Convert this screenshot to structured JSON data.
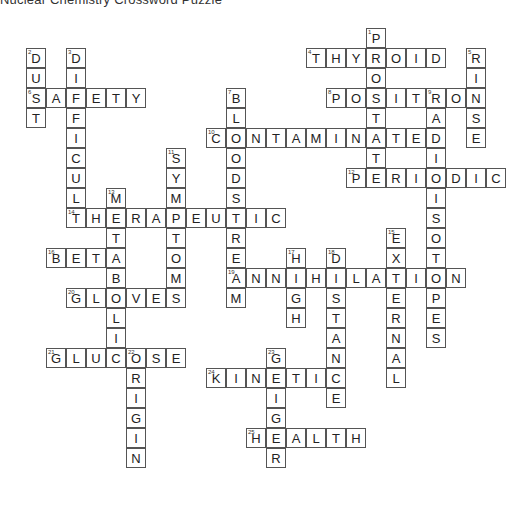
{
  "title": "Nuclear Chemistry Crossword Puzzle",
  "grid": {
    "origin_x": 26,
    "origin_y": 28,
    "cell_size": 20,
    "border_color": "#555555"
  },
  "words": [
    {
      "num": 1,
      "dir": "down",
      "answer": "PROSTATE",
      "col": 17,
      "row": 0
    },
    {
      "num": 2,
      "dir": "down",
      "answer": "DUST",
      "col": 0,
      "row": 1
    },
    {
      "num": 3,
      "dir": "down",
      "answer": "DIFFICULT",
      "col": 2,
      "row": 1
    },
    {
      "num": 4,
      "dir": "across",
      "answer": "THYROID",
      "col": 14,
      "row": 1
    },
    {
      "num": 5,
      "dir": "down",
      "answer": "RINSE",
      "col": 22,
      "row": 1
    },
    {
      "num": 6,
      "dir": "across",
      "answer": "SAFETY",
      "col": 0,
      "row": 3
    },
    {
      "num": 7,
      "dir": "down",
      "answer": "BLOODSTREAM",
      "col": 10,
      "row": 3
    },
    {
      "num": 8,
      "dir": "across",
      "answer": "POSITRON",
      "col": 15,
      "row": 3
    },
    {
      "num": 9,
      "dir": "down",
      "answer": "RADIOISOTOPES",
      "col": 20,
      "row": 3
    },
    {
      "num": 10,
      "dir": "across",
      "answer": "CONTAMINATED",
      "col": 9,
      "row": 5
    },
    {
      "num": 11,
      "dir": "down",
      "answer": "SYMPTOMS",
      "col": 7,
      "row": 6
    },
    {
      "num": 12,
      "dir": "across",
      "answer": "PERIODIC",
      "col": 16,
      "row": 7
    },
    {
      "num": 13,
      "dir": "down",
      "answer": "METABOLIC",
      "col": 4,
      "row": 8
    },
    {
      "num": 14,
      "dir": "across",
      "answer": "THERAPEUTIC",
      "col": 2,
      "row": 9
    },
    {
      "num": 15,
      "dir": "down",
      "answer": "EXTERNAL",
      "col": 18,
      "row": 10
    },
    {
      "num": 16,
      "dir": "across",
      "answer": "BETA",
      "col": 1,
      "row": 11
    },
    {
      "num": 17,
      "dir": "down",
      "answer": "HIGH",
      "col": 13,
      "row": 11
    },
    {
      "num": 18,
      "dir": "down",
      "answer": "DISTANCE",
      "col": 15,
      "row": 11
    },
    {
      "num": 19,
      "dir": "across",
      "answer": "ANNIHILATION",
      "col": 10,
      "row": 12
    },
    {
      "num": 20,
      "dir": "across",
      "answer": "GLOVES",
      "col": 2,
      "row": 13
    },
    {
      "num": 21,
      "dir": "across",
      "answer": "GLUCOSE",
      "col": 1,
      "row": 16
    },
    {
      "num": 22,
      "dir": "down",
      "answer": "ORIGIN",
      "col": 5,
      "row": 16
    },
    {
      "num": 23,
      "dir": "down",
      "answer": "GEIGER",
      "col": 12,
      "row": 16
    },
    {
      "num": 24,
      "dir": "across",
      "answer": "KINETIC",
      "col": 9,
      "row": 17
    },
    {
      "num": 25,
      "dir": "across",
      "answer": "HEALTH",
      "col": 11,
      "row": 20
    }
  ]
}
